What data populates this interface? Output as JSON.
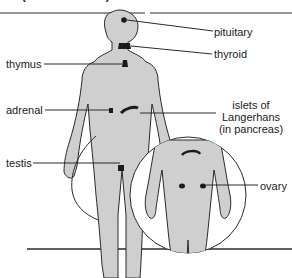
{
  "header": {
    "caption": "(interstitial cells)"
  },
  "labels": {
    "pituitary": "pituitary",
    "thyroid": "thyroid",
    "thymus": "thymus",
    "adrenal": "adrenal",
    "islets_line1": "islets of",
    "islets_line2": "Langerhans",
    "islets_line3": "(in pancreas)",
    "testis": "testis",
    "ovary": "ovary"
  },
  "colors": {
    "body_fill": "#cfcfcf",
    "outline": "#2a2a2a",
    "gland": "#1a1a1a",
    "leader_line": "#2a2a2a"
  }
}
